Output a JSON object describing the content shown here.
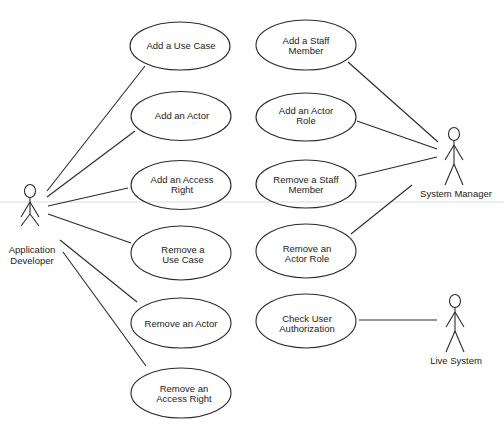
{
  "diagram": {
    "type": "UML use case diagram",
    "colors": {
      "stroke": "#2a2a2a",
      "text": "#222222",
      "background": "#ffffff"
    },
    "actors": [
      {
        "id": "app_dev",
        "label_lines": [
          "Application",
          "Developer"
        ],
        "icon": "stick-figure-icon"
      },
      {
        "id": "sys_mgr",
        "label_lines": [
          "System Manager"
        ],
        "icon": "stick-figure-icon"
      },
      {
        "id": "live_sys",
        "label_lines": [
          "Live System"
        ],
        "icon": "stick-figure-icon"
      }
    ],
    "use_cases": [
      {
        "id": "uc1",
        "label_lines": [
          "Add a Use Case"
        ]
      },
      {
        "id": "uc2",
        "label_lines": [
          "Add an Actor"
        ]
      },
      {
        "id": "uc3",
        "label_lines": [
          "Add an Access",
          "Right"
        ]
      },
      {
        "id": "uc4",
        "label_lines": [
          "Remove a",
          "Use Case"
        ]
      },
      {
        "id": "uc5",
        "label_lines": [
          "Remove an Actor"
        ]
      },
      {
        "id": "uc6",
        "label_lines": [
          "Remove an",
          "Access Right"
        ]
      },
      {
        "id": "uc7",
        "label_lines": [
          "Add a Staff",
          "Member"
        ]
      },
      {
        "id": "uc8",
        "label_lines": [
          "Add an Actor",
          "Role"
        ]
      },
      {
        "id": "uc9",
        "label_lines": [
          "Remove a Staff",
          "Member"
        ]
      },
      {
        "id": "uc10",
        "label_lines": [
          "Remove an",
          "Actor Role"
        ]
      },
      {
        "id": "uc11",
        "label_lines": [
          "Check User",
          "Authorization"
        ]
      }
    ],
    "associations": [
      {
        "from": "app_dev",
        "to": "uc1"
      },
      {
        "from": "app_dev",
        "to": "uc2"
      },
      {
        "from": "app_dev",
        "to": "uc3"
      },
      {
        "from": "app_dev",
        "to": "uc4"
      },
      {
        "from": "app_dev",
        "to": "uc5"
      },
      {
        "from": "app_dev",
        "to": "uc6"
      },
      {
        "from": "sys_mgr",
        "to": "uc7"
      },
      {
        "from": "sys_mgr",
        "to": "uc8"
      },
      {
        "from": "sys_mgr",
        "to": "uc9"
      },
      {
        "from": "sys_mgr",
        "to": "uc10"
      },
      {
        "from": "live_sys",
        "to": "uc11"
      }
    ]
  },
  "labels": {
    "app_dev_1": "Application",
    "app_dev_2": "Developer",
    "sys_mgr": "System Manager",
    "live_sys": "Live System",
    "uc1_1": "Add a Use Case",
    "uc2_1": "Add an Actor",
    "uc3_1": "Add an Access",
    "uc3_2": "Right",
    "uc4_1": "Remove a",
    "uc4_2": "Use Case",
    "uc5_1": "Remove an Actor",
    "uc6_1": "Remove an",
    "uc6_2": "Access Right",
    "uc7_1": "Add a Staff",
    "uc7_2": "Member",
    "uc8_1": "Add an Actor",
    "uc8_2": "Role",
    "uc9_1": "Remove a Staff",
    "uc9_2": "Member",
    "uc10_1": "Remove an",
    "uc10_2": "Actor Role",
    "uc11_1": "Check User",
    "uc11_2": "Authorization"
  }
}
